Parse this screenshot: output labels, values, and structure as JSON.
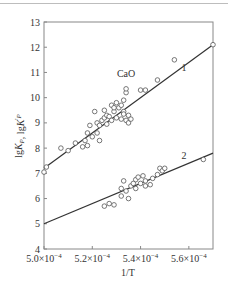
{
  "chart_data": {
    "type": "scatter",
    "title": "",
    "xlabel": "1/T",
    "ylabel": "lgK_P, lgK'_P",
    "xlim": [
      0.0005,
      0.00057
    ],
    "ylim": [
      4,
      13
    ],
    "xticks": [
      0.0005,
      0.00052,
      0.00054,
      0.00056
    ],
    "xtick_labels": [
      {
        "mant": "5.0×10",
        "exp": "−4"
      },
      {
        "mant": "5.2×10",
        "exp": "−4"
      },
      {
        "mant": "5.4×10",
        "exp": "−4"
      },
      {
        "mant": "5.6×10",
        "exp": "−4"
      }
    ],
    "yticks": [
      4,
      5,
      6,
      7,
      8,
      9,
      10,
      11,
      12,
      13
    ],
    "ytick_labels": [
      "4",
      "5",
      "6",
      "7",
      "8",
      "9",
      "10",
      "11",
      "12",
      "13"
    ],
    "grid": false,
    "legend": "none",
    "annotations": [
      {
        "text": "CaO",
        "x": 0.000534,
        "y": 10.8
      },
      {
        "text": "1",
        "x": 0.000558,
        "y": 11.05
      },
      {
        "text": "2",
        "x": 0.000558,
        "y": 7.55
      }
    ],
    "series": [
      {
        "name": "1",
        "marker": "open-circle",
        "fit_line": {
          "x": [
            0.0005,
            0.00057
          ],
          "y": [
            7.2,
            12.1
          ]
        },
        "points": [
          [
            0.0005,
            7.05
          ],
          [
            0.000501,
            7.25
          ],
          [
            0.000507,
            8.0
          ],
          [
            0.00051,
            7.9
          ],
          [
            0.000513,
            8.2
          ],
          [
            0.000516,
            8.05
          ],
          [
            0.000517,
            8.3
          ],
          [
            0.000518,
            8.6
          ],
          [
            0.000518,
            8.1
          ],
          [
            0.000519,
            8.9
          ],
          [
            0.00052,
            8.45
          ],
          [
            0.000521,
            9.45
          ],
          [
            0.000522,
            8.6
          ],
          [
            0.000522,
            9.0
          ],
          [
            0.000523,
            8.9
          ],
          [
            0.000523,
            8.3
          ],
          [
            0.000524,
            9.1
          ],
          [
            0.000525,
            9.2
          ],
          [
            0.000525,
            9.5
          ],
          [
            0.000526,
            9.3
          ],
          [
            0.000526,
            8.95
          ],
          [
            0.000527,
            9.25
          ],
          [
            0.000528,
            9.7
          ],
          [
            0.000528,
            9.1
          ],
          [
            0.000529,
            9.45
          ],
          [
            0.000529,
            9.6
          ],
          [
            0.00053,
            9.8
          ],
          [
            0.00053,
            9.2
          ],
          [
            0.000531,
            9.6
          ],
          [
            0.000532,
            9.7
          ],
          [
            0.000532,
            9.15
          ],
          [
            0.000533,
            9.9
          ],
          [
            0.000533,
            9.45
          ],
          [
            0.000534,
            10.2
          ],
          [
            0.000534,
            10.35
          ],
          [
            0.000534,
            9.1
          ],
          [
            0.000535,
            9.3
          ],
          [
            0.000535,
            9.0
          ],
          [
            0.000536,
            9.15
          ],
          [
            0.000533,
            9.35
          ],
          [
            0.00054,
            10.3
          ],
          [
            0.000542,
            10.3
          ],
          [
            0.000547,
            10.7
          ],
          [
            0.000554,
            11.5
          ],
          [
            0.00057,
            12.1
          ]
        ]
      },
      {
        "name": "2",
        "marker": "open-circle",
        "fit_line": {
          "x": [
            0.0005,
            0.00057
          ],
          "y": [
            5.0,
            7.8
          ]
        },
        "points": [
          [
            0.000525,
            5.7
          ],
          [
            0.000527,
            5.8
          ],
          [
            0.000529,
            5.75
          ],
          [
            0.000532,
            6.1
          ],
          [
            0.000532,
            6.4
          ],
          [
            0.000533,
            6.7
          ],
          [
            0.000534,
            6.3
          ],
          [
            0.000535,
            6.0
          ],
          [
            0.000536,
            6.5
          ],
          [
            0.000537,
            6.6
          ],
          [
            0.000538,
            6.75
          ],
          [
            0.000538,
            6.4
          ],
          [
            0.000539,
            6.85
          ],
          [
            0.00054,
            6.6
          ],
          [
            0.000541,
            6.9
          ],
          [
            0.000542,
            6.5
          ],
          [
            0.000542,
            6.7
          ],
          [
            0.000544,
            6.55
          ],
          [
            0.000545,
            6.8
          ],
          [
            0.000547,
            6.95
          ],
          [
            0.000548,
            7.2
          ],
          [
            0.000549,
            7.1
          ],
          [
            0.00055,
            7.2
          ],
          [
            0.000566,
            7.55
          ]
        ]
      }
    ]
  }
}
